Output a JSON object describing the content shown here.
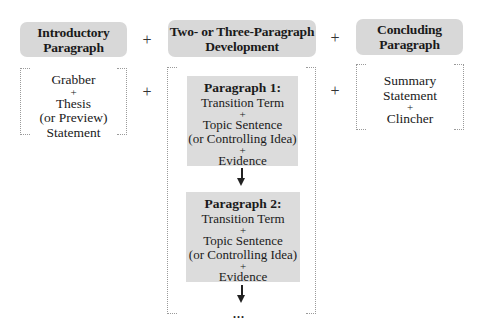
{
  "columns": [
    {
      "header": [
        "Introductory",
        "Paragraph"
      ],
      "content": [
        "Grabber",
        "+",
        "Thesis",
        "(or Preview)",
        "Statement"
      ]
    },
    {
      "header": [
        "Two- or Three-Paragraph",
        "Development"
      ],
      "paragraphs": [
        {
          "title": "Paragraph 1:",
          "lines": [
            "Transition Term",
            "+",
            "Topic Sentence",
            "(or Controlling Idea)",
            "+",
            "Evidence"
          ]
        },
        {
          "title": "Paragraph 2:",
          "lines": [
            "Transition Term",
            "+",
            "Topic Sentence",
            "(or Controlling Idea)",
            "+",
            "Evidence"
          ]
        }
      ],
      "continuation": "..."
    },
    {
      "header": [
        "Concluding",
        "Paragraph"
      ],
      "content": [
        "Summary",
        "Statement",
        "+",
        "Clincher"
      ]
    }
  ],
  "operators": {
    "plus": "+"
  },
  "colors": {
    "header_fill": "#d8d8d8",
    "paragraph_fill": "#dcdcdc",
    "frame_dots": "#9a9a9a"
  }
}
